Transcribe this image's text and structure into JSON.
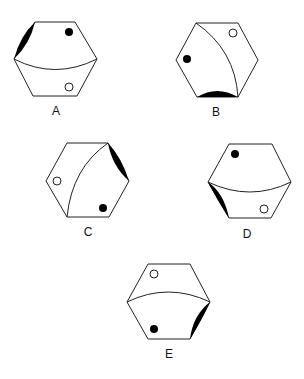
{
  "figure": {
    "options": [
      {
        "label": "A",
        "crescent_edge": "top-left",
        "black_dot": "upper-right",
        "white_dot": "lower-right",
        "curve": "horizontal, sagging"
      },
      {
        "label": "B",
        "crescent_edge": "bottom",
        "black_dot": "left",
        "white_dot": "upper-right",
        "curve": "top-left to bottom-right"
      },
      {
        "label": "C",
        "crescent_edge": "top-right",
        "black_dot": "lower-right",
        "white_dot": "left",
        "curve": "top-right to bottom-left"
      },
      {
        "label": "D",
        "crescent_edge": "bottom-left",
        "black_dot": "upper-left",
        "white_dot": "lower-right",
        "curve": "horizontal, sagging"
      },
      {
        "label": "E",
        "crescent_edge": "bottom-right",
        "black_dot": "lower-left",
        "white_dot": "upper-left",
        "curve": "horizontal, arched up"
      }
    ]
  },
  "colors": {
    "stroke": "#222222",
    "fill_black": "#000000",
    "fill_white": "#ffffff"
  }
}
